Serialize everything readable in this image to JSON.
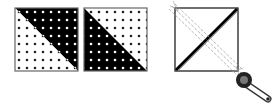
{
  "diagram": {
    "colors": {
      "dark": "#000000",
      "light": "#ffffff",
      "outline": "#555555",
      "dot_on_light": "#222222",
      "dot_on_dark": "#ffffff"
    },
    "blocks": [
      {
        "id": "hst-block-1",
        "dark_half": "upper-right",
        "x": 15,
        "y": 8,
        "size": 63
      },
      {
        "id": "hst-block-2",
        "dark_half": "lower-left",
        "x": 84,
        "y": 8,
        "size": 63
      }
    ],
    "stitch_square": {
      "x": 175,
      "y": 8,
      "size": 63,
      "cut_line": "dark diagonal lower-left to upper-right",
      "sew_lines": "dashed, parallel to upper-left to lower-right diagonal"
    },
    "tool": "rotary-cutter"
  }
}
